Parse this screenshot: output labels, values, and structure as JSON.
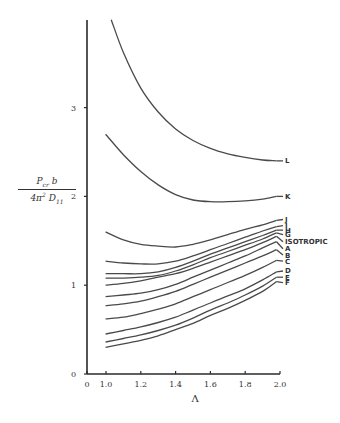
{
  "chart_data": {
    "type": "line",
    "title": "",
    "xlabel": "Λ",
    "ylabel_numerator": "P_cr b",
    "ylabel_denominator": "4π² D₁₁",
    "ylabel": "P_cr b / (4π² D₁₁)",
    "xlim": [
      0,
      2.0
    ],
    "ylim": [
      0,
      4.0
    ],
    "x_axis_break": "axis jumps from 0 to 1.0",
    "x_ticks": [
      "0",
      "1.0",
      "1.2",
      "1.4",
      "1.6",
      "1.8",
      "2.0"
    ],
    "x_tick_values": [
      0,
      1.0,
      1.2,
      1.4,
      1.6,
      1.8,
      2.0
    ],
    "y_ticks": [
      "0",
      "1",
      "2",
      "3"
    ],
    "y_tick_values": [
      0,
      1,
      2,
      3
    ],
    "grid": false,
    "legend": "inline labels at right end of curves",
    "series": [
      {
        "name": "L",
        "x": [
          1.03,
          1.1,
          1.2,
          1.3,
          1.4,
          1.5,
          1.6,
          1.7,
          1.8,
          1.9,
          1.98
        ],
        "values": [
          3.99,
          3.62,
          3.22,
          2.95,
          2.76,
          2.63,
          2.54,
          2.48,
          2.44,
          2.41,
          2.4
        ]
      },
      {
        "name": "K",
        "x": [
          0.98,
          1.1,
          1.2,
          1.3,
          1.4,
          1.5,
          1.6,
          1.7,
          1.8,
          1.9,
          1.98
        ],
        "values": [
          2.7,
          2.47,
          2.28,
          2.13,
          2.02,
          1.96,
          1.94,
          1.94,
          1.95,
          1.97,
          2.0
        ]
      },
      {
        "name": "J",
        "x": [
          0.98,
          1.1,
          1.2,
          1.3,
          1.4,
          1.5,
          1.6,
          1.7,
          1.8,
          1.9,
          1.98
        ],
        "values": [
          1.6,
          1.51,
          1.46,
          1.44,
          1.43,
          1.46,
          1.51,
          1.57,
          1.63,
          1.68,
          1.73
        ]
      },
      {
        "name": "I",
        "x": [
          0.98,
          1.1,
          1.2,
          1.3,
          1.4,
          1.5,
          1.6,
          1.7,
          1.8,
          1.9,
          1.98
        ],
        "values": [
          1.27,
          1.25,
          1.24,
          1.24,
          1.27,
          1.33,
          1.4,
          1.47,
          1.54,
          1.61,
          1.66
        ]
      },
      {
        "name": "H",
        "x": [
          0.98,
          1.1,
          1.2,
          1.3,
          1.4,
          1.5,
          1.6,
          1.7,
          1.8,
          1.9,
          1.98
        ],
        "values": [
          1.13,
          1.13,
          1.13,
          1.15,
          1.2,
          1.27,
          1.35,
          1.42,
          1.49,
          1.56,
          1.62
        ]
      },
      {
        "name": "G",
        "x": [
          0.98,
          1.1,
          1.2,
          1.3,
          1.4,
          1.5,
          1.6,
          1.7,
          1.8,
          1.9,
          1.98
        ],
        "values": [
          1.08,
          1.08,
          1.09,
          1.11,
          1.16,
          1.23,
          1.31,
          1.38,
          1.45,
          1.52,
          1.59
        ]
      },
      {
        "name": "ISOTROPIC",
        "x": [
          0.98,
          1.1,
          1.2,
          1.3,
          1.4,
          1.5,
          1.6,
          1.7,
          1.8,
          1.9,
          1.98
        ],
        "values": [
          1.0,
          1.02,
          1.05,
          1.09,
          1.13,
          1.19,
          1.26,
          1.33,
          1.4,
          1.48,
          1.55
        ]
      },
      {
        "name": "A",
        "x": [
          0.98,
          1.1,
          1.2,
          1.3,
          1.4,
          1.5,
          1.6,
          1.7,
          1.8,
          1.9,
          1.98
        ],
        "values": [
          0.87,
          0.89,
          0.91,
          0.95,
          1.01,
          1.09,
          1.17,
          1.25,
          1.33,
          1.42,
          1.49
        ]
      },
      {
        "name": "B",
        "x": [
          0.98,
          1.1,
          1.2,
          1.3,
          1.4,
          1.5,
          1.6,
          1.7,
          1.8,
          1.9,
          1.98
        ],
        "values": [
          0.77,
          0.79,
          0.82,
          0.87,
          0.93,
          1.01,
          1.09,
          1.17,
          1.25,
          1.33,
          1.4
        ]
      },
      {
        "name": "C",
        "x": [
          0.98,
          1.1,
          1.2,
          1.3,
          1.4,
          1.5,
          1.6,
          1.7,
          1.8,
          1.9,
          1.98
        ],
        "values": [
          0.62,
          0.64,
          0.68,
          0.73,
          0.79,
          0.87,
          0.95,
          1.03,
          1.11,
          1.2,
          1.28
        ]
      },
      {
        "name": "D",
        "x": [
          0.98,
          1.1,
          1.2,
          1.3,
          1.4,
          1.5,
          1.6,
          1.7,
          1.8,
          1.9,
          1.98
        ],
        "values": [
          0.45,
          0.49,
          0.53,
          0.58,
          0.64,
          0.72,
          0.8,
          0.88,
          0.96,
          1.06,
          1.15
        ]
      },
      {
        "name": "E",
        "x": [
          0.98,
          1.1,
          1.2,
          1.3,
          1.4,
          1.5,
          1.6,
          1.7,
          1.8,
          1.9,
          1.98
        ],
        "values": [
          0.36,
          0.4,
          0.44,
          0.49,
          0.55,
          0.63,
          0.72,
          0.8,
          0.89,
          0.99,
          1.09
        ]
      },
      {
        "name": "F",
        "x": [
          0.98,
          1.1,
          1.2,
          1.3,
          1.4,
          1.5,
          1.6,
          1.7,
          1.8,
          1.9,
          1.98
        ],
        "values": [
          0.3,
          0.34,
          0.38,
          0.43,
          0.5,
          0.57,
          0.66,
          0.74,
          0.83,
          0.93,
          1.04
        ]
      }
    ],
    "label_positions": {
      "L": 2.4,
      "K": 2.0,
      "J": 1.74,
      "I": 1.67,
      "H": 1.62,
      "G": 1.57,
      "ISOTROPIC": 1.49,
      "A": 1.41,
      "B": 1.34,
      "C": 1.27,
      "D": 1.16,
      "E": 1.09,
      "F": 1.03
    }
  },
  "axes": {
    "x_title": "Λ",
    "y_title_num": "P",
    "y_title_num_sub": "cr",
    "y_title_num_tail": " b",
    "y_title_den": "4π",
    "y_title_den_sup": "2",
    "y_title_den_mid": " D",
    "y_title_den_sub": "11"
  }
}
